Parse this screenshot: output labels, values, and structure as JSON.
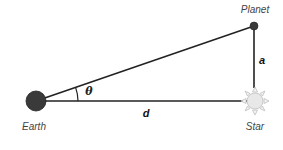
{
  "diagram": {
    "type": "parallax-geometry",
    "nodes": {
      "earth": {
        "label": "Earth",
        "x": 36,
        "y": 101,
        "r": 10,
        "color": "#3a3a3a"
      },
      "planet": {
        "label": "Planet",
        "x": 254,
        "y": 26,
        "r": 4,
        "color": "#3a3a3a"
      },
      "star": {
        "label": "Star",
        "x": 255,
        "y": 101,
        "r": 8,
        "color": "#e6e6e6",
        "ray_color": "#c8c8c8"
      }
    },
    "edges": [
      {
        "from": "earth",
        "to": "planet"
      },
      {
        "from": "earth",
        "to": "star",
        "label": "d"
      },
      {
        "from": "star",
        "to": "planet",
        "label": "a"
      }
    ],
    "angle": {
      "vertex": "earth",
      "label": "θ"
    },
    "labels": {
      "earth": "Earth",
      "planet": "Planet",
      "star": "Star",
      "distance": "d",
      "separation": "a",
      "angle": "θ"
    }
  }
}
